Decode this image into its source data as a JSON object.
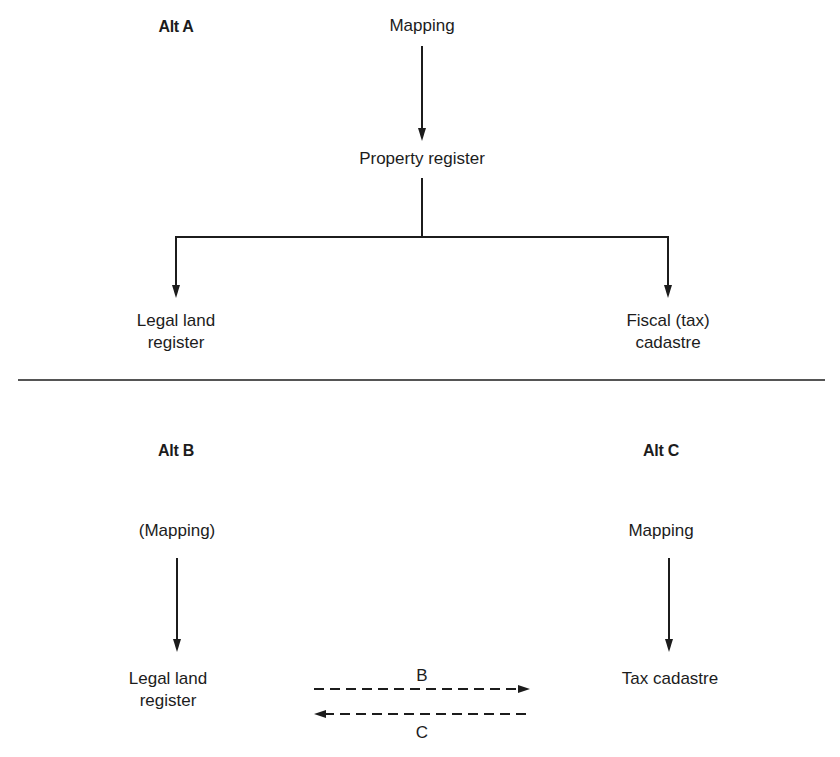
{
  "diagram": {
    "alt_a": {
      "title": "Alt A",
      "nodes": {
        "mapping": "Mapping",
        "property_register": "Property register",
        "legal_land_register_line1": "Legal land",
        "legal_land_register_line2": "register",
        "fiscal_cadastre_line1": "Fiscal (tax)",
        "fiscal_cadastre_line2": "cadastre"
      }
    },
    "alt_b": {
      "title": "Alt B",
      "nodes": {
        "mapping": "(Mapping)",
        "legal_land_register_line1": "Legal land",
        "legal_land_register_line2": "register"
      }
    },
    "alt_c": {
      "title": "Alt C",
      "nodes": {
        "mapping": "Mapping",
        "tax_cadastre": "Tax cadastre"
      }
    },
    "exchange": {
      "arrow_b_label": "B",
      "arrow_c_label": "C"
    },
    "colors": {
      "ink": "#1c1c1c",
      "background": "#ffffff",
      "divider": "#555555"
    }
  }
}
